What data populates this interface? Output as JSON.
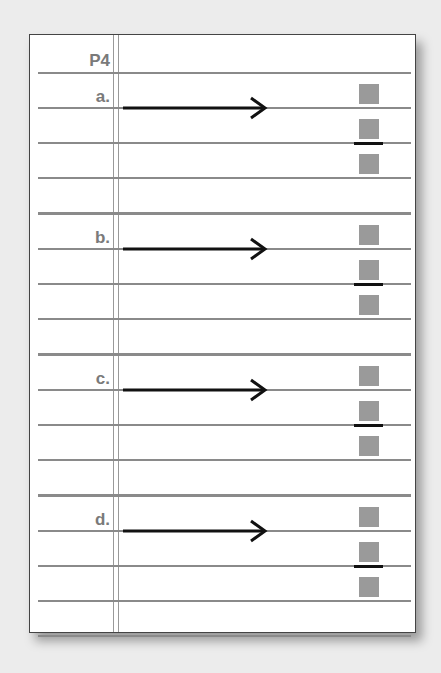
{
  "header": {
    "label": "P4"
  },
  "items": [
    {
      "label": "a."
    },
    {
      "label": "b."
    },
    {
      "label": "c."
    },
    {
      "label": "d."
    }
  ],
  "colors": {
    "line": "#8a8a8a",
    "square": "#9a9a9a",
    "label": "#7a7a7a",
    "arrow": "#111111"
  }
}
